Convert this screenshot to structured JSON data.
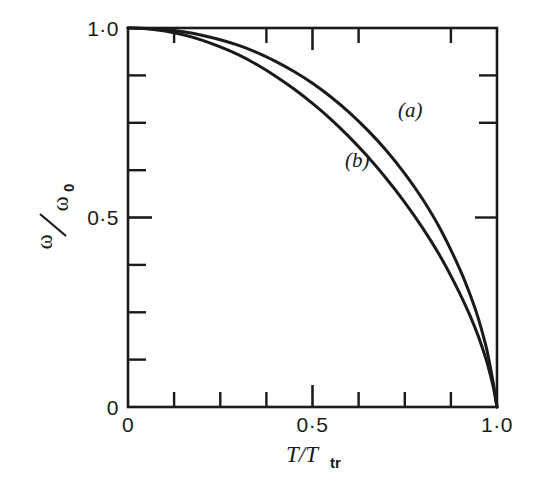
{
  "chart_data": {
    "type": "line",
    "title": "",
    "subtitle": "",
    "xlabel": "T/T_tr",
    "xlabel_main": "T/T",
    "xlabel_sub": "tr",
    "ylabel": "ω/ω₀",
    "ylabel_num": "ω",
    "ylabel_slash": "/",
    "ylabel_den": "ω",
    "ylabel_den_sub": "0",
    "xlim": [
      0,
      1
    ],
    "ylim": [
      0,
      1
    ],
    "grid": false,
    "legend_position": "inline-annotation",
    "xticks": [
      0,
      0.5,
      1
    ],
    "xtick_labels": [
      "0",
      "0·5",
      "1·0"
    ],
    "xminor_ticks": [
      0.125,
      0.25,
      0.375,
      0.625,
      0.75,
      0.875
    ],
    "yticks": [
      0,
      0.5,
      1
    ],
    "ytick_labels": [
      "0",
      "0·5",
      "1·0"
    ],
    "yminor_ticks": [
      0.125,
      0.25,
      0.375,
      0.625,
      0.75,
      0.875
    ],
    "line_color": "#1a1a1a",
    "frame_color": "#1a1a1a",
    "background_color": "#ffffff",
    "annotations": [
      {
        "text": "(a)",
        "x": 0.78,
        "y": 0.76,
        "curve": "a"
      },
      {
        "text": "(b)",
        "x": 0.62,
        "y": 0.6,
        "curve": "b"
      }
    ],
    "series": [
      {
        "name": "(a)",
        "label": "(a)",
        "x": [
          0.0,
          0.05,
          0.1,
          0.15,
          0.2,
          0.25,
          0.3,
          0.35,
          0.4,
          0.45,
          0.5,
          0.55,
          0.6,
          0.65,
          0.7,
          0.75,
          0.8,
          0.85,
          0.9,
          0.93,
          0.95,
          0.97,
          0.98,
          0.99,
          1.0
        ],
        "values": [
          1.0,
          0.999,
          0.996,
          0.99,
          0.981,
          0.969,
          0.954,
          0.935,
          0.912,
          0.885,
          0.854,
          0.818,
          0.777,
          0.73,
          0.677,
          0.616,
          0.546,
          0.463,
          0.362,
          0.289,
          0.232,
          0.161,
          0.115,
          0.063,
          0.0
        ]
      },
      {
        "name": "(b)",
        "label": "(b)",
        "x": [
          0.0,
          0.05,
          0.1,
          0.15,
          0.2,
          0.25,
          0.3,
          0.35,
          0.4,
          0.45,
          0.5,
          0.55,
          0.6,
          0.65,
          0.7,
          0.75,
          0.8,
          0.85,
          0.9,
          0.93,
          0.95,
          0.97,
          0.98,
          0.99,
          1.0
        ],
        "values": [
          1.0,
          0.998,
          0.992,
          0.982,
          0.968,
          0.95,
          0.929,
          0.903,
          0.873,
          0.839,
          0.801,
          0.759,
          0.712,
          0.66,
          0.603,
          0.54,
          0.47,
          0.391,
          0.298,
          0.234,
          0.185,
          0.127,
          0.092,
          0.052,
          0.0
        ]
      }
    ]
  },
  "labels": {
    "y_top": "1·0",
    "y_mid": "0·5",
    "y_bottom": "0",
    "x_left": "0",
    "x_mid": "0·5",
    "x_right": "1·0",
    "curve_a": "(a)",
    "curve_b": "(b)",
    "x_axis_main": "T/T",
    "x_axis_sub": "tr",
    "y_axis_num": "ω",
    "y_axis_slash": "⁄",
    "y_axis_den": "ω",
    "y_axis_den_sub": "0"
  }
}
